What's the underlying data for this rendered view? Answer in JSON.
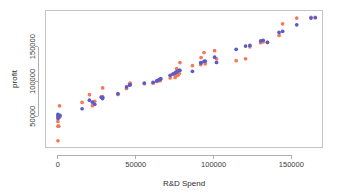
{
  "chart_data": {
    "type": "scatter",
    "title": "",
    "xlabel": "R&D Spend",
    "ylabel": "profit",
    "xlim": [
      -8000,
      170000
    ],
    "ylim": [
      5000,
      202000
    ],
    "xticks": [
      0,
      50000,
      100000,
      150000
    ],
    "xticklabels": [
      "0",
      "50000",
      "100000",
      "150000"
    ],
    "yticks": [
      50000,
      100000,
      150000
    ],
    "yticklabels": [
      "50000",
      "100000",
      "150000"
    ],
    "grid": false,
    "legend": "none",
    "colors": {
      "actual": "#f4795b",
      "predicted": "#5b5bc8",
      "axis": "#9a9a9a",
      "frame": "#b5b5b5",
      "background": "#ffffff"
    },
    "series": [
      {
        "name": "actual",
        "color": "#f4795b",
        "marker": "circle",
        "points": [
          [
            0,
            14681
          ],
          [
            0,
            42560
          ],
          [
            0,
            35673
          ],
          [
            0,
            49490
          ],
          [
            1000,
            64926
          ],
          [
            1315,
            49490
          ],
          [
            542,
            35673
          ],
          [
            15505,
            69758
          ],
          [
            22177,
            65200
          ],
          [
            20229,
            81005
          ],
          [
            23640,
            71498
          ],
          [
            27892,
            77799
          ],
          [
            28754,
            90708
          ],
          [
            28663,
            78239
          ],
          [
            38558,
            81229
          ],
          [
            44070,
            89949
          ],
          [
            46014,
            96479
          ],
          [
            46426,
            97427
          ],
          [
            55493,
            96778
          ],
          [
            61136,
            97483
          ],
          [
            63408,
            99938
          ],
          [
            64664,
            101004
          ],
          [
            65605,
            101004
          ],
          [
            66051,
            103282
          ],
          [
            72107,
            105008
          ],
          [
            73994,
            110352
          ],
          [
            75328,
            105733
          ],
          [
            75810,
            108552
          ],
          [
            76253,
            118474
          ],
          [
            77044,
            108733
          ],
          [
            77044,
            112293
          ],
          [
            78013,
            111313
          ],
          [
            78389,
            127056
          ],
          [
            86419,
            122776
          ],
          [
            91749,
            124266
          ],
          [
            93863,
            141585
          ],
          [
            91992,
            134307
          ],
          [
            94657,
            125370
          ],
          [
            100672,
            144259
          ],
          [
            101913,
            132602
          ],
          [
            114523,
            129917
          ],
          [
            120543,
            132602
          ],
          [
            123334,
            149760
          ],
          [
            130298,
            155753
          ],
          [
            131877,
            156991
          ],
          [
            134615,
            156122
          ],
          [
            142107,
            166188
          ],
          [
            144372,
            182902
          ],
          [
            153441,
            191050
          ],
          [
            162598,
            192262
          ],
          [
            165349,
            192262
          ]
        ]
      },
      {
        "name": "predicted",
        "color": "#5b5bc8",
        "marker": "circle",
        "points": [
          [
            0,
            47000
          ],
          [
            0,
            50500
          ],
          [
            0,
            52800
          ],
          [
            542,
            47900
          ],
          [
            1315,
            51400
          ],
          [
            15505,
            60700
          ],
          [
            20229,
            73100
          ],
          [
            22177,
            70200
          ],
          [
            23640,
            67200
          ],
          [
            27892,
            77100
          ],
          [
            28663,
            75300
          ],
          [
            28754,
            76800
          ],
          [
            38558,
            82400
          ],
          [
            44070,
            92100
          ],
          [
            46014,
            94600
          ],
          [
            46426,
            95400
          ],
          [
            55493,
            97600
          ],
          [
            61136,
            98800
          ],
          [
            63408,
            100900
          ],
          [
            64664,
            102100
          ],
          [
            65605,
            102900
          ],
          [
            66051,
            104100
          ],
          [
            72107,
            108800
          ],
          [
            73994,
            110900
          ],
          [
            75328,
            112300
          ],
          [
            75810,
            113100
          ],
          [
            76253,
            113900
          ],
          [
            77044,
            114900
          ],
          [
            78013,
            115800
          ],
          [
            78389,
            116100
          ],
          [
            86419,
            114600
          ],
          [
            91749,
            127100
          ],
          [
            91992,
            126500
          ],
          [
            93863,
            128900
          ],
          [
            94657,
            129100
          ],
          [
            100672,
            134900
          ],
          [
            101913,
            127300
          ],
          [
            114523,
            146200
          ],
          [
            120543,
            150900
          ],
          [
            123334,
            151800
          ],
          [
            130298,
            158300
          ],
          [
            131877,
            159200
          ],
          [
            134615,
            156200
          ],
          [
            142107,
            170600
          ],
          [
            144372,
            172100
          ],
          [
            153441,
            181400
          ],
          [
            162598,
            191100
          ],
          [
            165349,
            191600
          ]
        ]
      }
    ]
  }
}
